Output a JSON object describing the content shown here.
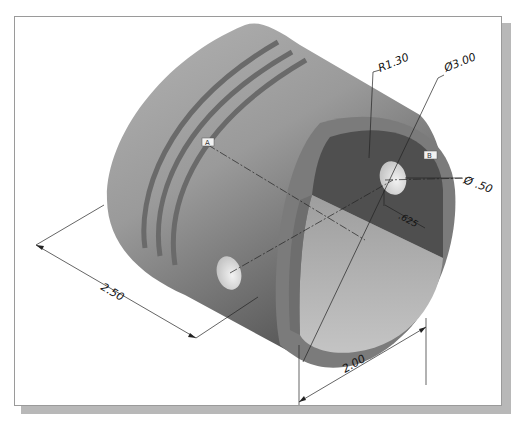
{
  "figure": {
    "type": "isometric-cad-part",
    "colors": {
      "background": "#ffffff",
      "frame_border": "#9a9a9a",
      "frame_shadow": "#b8b8b8",
      "body_light": "#a9a9a9",
      "body_dark": "#5c5c5c",
      "groove": "#6d6d6d",
      "rim": "#7a7a7a",
      "inner_dark": "#4e4e4e",
      "inner_light": "#b9b9b9",
      "hole": "#e6e6e6",
      "dimension_line": "#222222"
    }
  },
  "dimensions": {
    "radius": "R1.30",
    "outer_diameter": "Ø3.00",
    "hole_diameter": "Ø .50",
    "offset": ".625",
    "length": "2.50",
    "width": "2.00"
  },
  "annotations": {
    "label_a": "A",
    "label_b": "B"
  }
}
